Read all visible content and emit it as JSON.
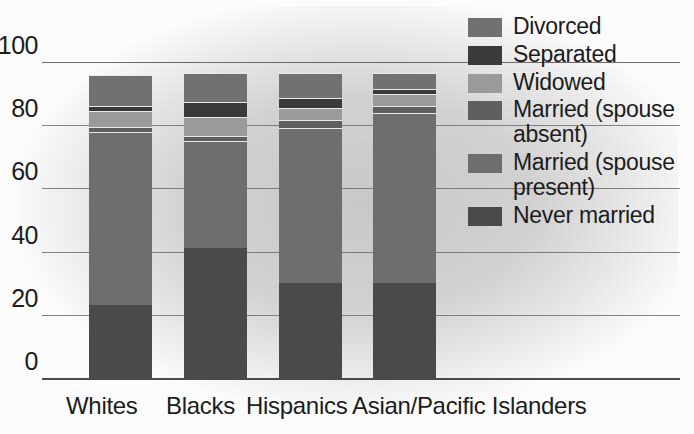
{
  "chart_data": {
    "type": "bar",
    "subtype": "stacked-bar-100",
    "title": "",
    "xlabel": "",
    "ylabel": "",
    "ylim": [
      0,
      100
    ],
    "yticks": [
      0,
      20,
      40,
      60,
      80,
      100
    ],
    "grid": true,
    "legend_position": "right",
    "categories": [
      "Whites",
      "Blacks",
      "Hispanics",
      "Asian/Pacific Islanders"
    ],
    "series": [
      {
        "name": "Never married",
        "color": "#4a4a4a",
        "values": [
          23,
          41,
          30,
          30
        ]
      },
      {
        "name": "Married (spouse present)",
        "color": "#6e6e6e",
        "values": [
          55,
          34,
          49,
          54
        ]
      },
      {
        "name": "Married (spouse absent)",
        "color": "#5f5f5f",
        "values": [
          1.5,
          1.5,
          2.5,
          2
        ]
      },
      {
        "name": "Widowed",
        "color": "#9a9a9a",
        "values": [
          5,
          6,
          4,
          4
        ]
      },
      {
        "name": "Separated",
        "color": "#3a3a3a",
        "values": [
          1.5,
          5,
          3,
          1.5
        ]
      },
      {
        "name": "Divorced",
        "color": "#717171",
        "values": [
          10,
          9,
          8,
          5
        ]
      }
    ]
  },
  "axis": {
    "tick_labels": [
      "100",
      "80",
      "60",
      "40",
      "20",
      "0"
    ]
  },
  "legend": {
    "items": [
      {
        "label": "Divorced",
        "color": "#717171"
      },
      {
        "label": "Separated",
        "color": "#3a3a3a"
      },
      {
        "label": "Widowed",
        "color": "#9a9a9a"
      },
      {
        "label": "Married (spouse absent)",
        "color": "#5f5f5f"
      },
      {
        "label": "Married (spouse present)",
        "color": "#6e6e6e"
      },
      {
        "label": "Never married",
        "color": "#4a4a4a"
      }
    ]
  },
  "xaxis": {
    "labels": [
      "Whites",
      "Blacks",
      "Hispanics",
      "Asian/Pacific Islanders"
    ]
  }
}
